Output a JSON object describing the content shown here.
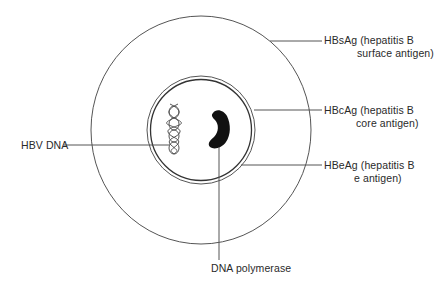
{
  "diagram": {
    "colors": {
      "line": "#555555",
      "text": "#2a2a2a",
      "fill": "#111111",
      "background": "#ffffff"
    },
    "labels": {
      "hbsag": {
        "line1": "HBsAg (hepatitis B",
        "line2": "surface antigen)"
      },
      "hbcag": {
        "line1": "HBcAg (hepatitis B",
        "line2": "core antigen)"
      },
      "hbeag": {
        "line1": "HBeAg (hepatitis B",
        "line2": "e antigen)"
      },
      "hbv_dna": "HBV DNA",
      "dna_polymerase": "DNA polymerase"
    },
    "components": [
      {
        "id": "outer-envelope",
        "shape": "circle",
        "label": "HBsAg"
      },
      {
        "id": "core-capsid-outer-ring",
        "shape": "circle",
        "label": "HBcAg"
      },
      {
        "id": "core-capsid-inner-ring",
        "shape": "circle",
        "label": "HBeAg"
      },
      {
        "id": "dna-helix",
        "shape": "double-helix",
        "label": "HBV DNA"
      },
      {
        "id": "polymerase",
        "shape": "kidney",
        "label": "DNA polymerase"
      }
    ]
  }
}
